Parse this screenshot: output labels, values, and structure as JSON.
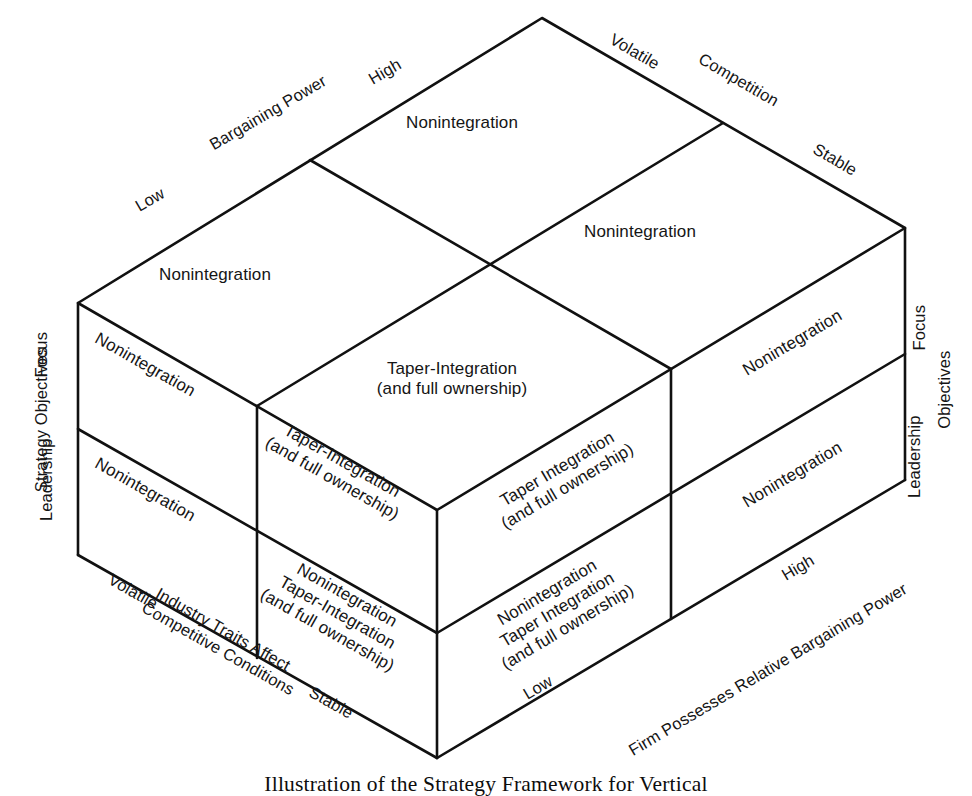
{
  "figure": {
    "caption": "Illustration of the Strategy Framework for Vertical",
    "type": "3d-cube-matrix-diagram"
  },
  "axes": {
    "top_back_left": {
      "name": "Bargaining Power",
      "ticks": [
        "Low",
        "High"
      ]
    },
    "top_back_right": {
      "name": "Competition",
      "ticks": [
        "Volatile",
        "Stable"
      ]
    },
    "left_vertical": {
      "name": "Strategy Objectives",
      "ticks": [
        "Focus",
        "Leadership"
      ]
    },
    "right_vertical": {
      "name": "Objectives",
      "ticks": [
        "Focus",
        "Leadership"
      ]
    },
    "bottom_front_left": {
      "name": "Industry Traits Affect Competitive Conditions",
      "name_line1": "Industry Traits Affect",
      "name_line2": "Competitive Conditions",
      "ticks": [
        "Volatile",
        "Stable"
      ]
    },
    "bottom_front_right": {
      "name": "Firm Possesses Relative Bargaining Power",
      "ticks": [
        "Low",
        "High"
      ]
    }
  },
  "top_face": {
    "cells": [
      {
        "id": "top-back-left",
        "text": "Nonintegration"
      },
      {
        "id": "top-back-right",
        "text": "Nonintegration"
      },
      {
        "id": "top-front-left",
        "text": "Nonintegration"
      },
      {
        "id": "top-front-right",
        "text": "Taper-Integration\n(and full ownership)"
      }
    ]
  },
  "left_face": {
    "cells": [
      {
        "id": "left-upper-back",
        "text": "Nonintegration"
      },
      {
        "id": "left-lower-back",
        "text": "Nonintegration"
      },
      {
        "id": "left-upper-front",
        "text": "Taper-Integration\n(and full ownership)"
      },
      {
        "id": "left-lower-front",
        "text": "Nonintegration\nTaper-Integration\n(and full ownership)"
      }
    ]
  },
  "right_face": {
    "cells": [
      {
        "id": "right-upper-left",
        "text": "Taper Integration\n(and full ownership)"
      },
      {
        "id": "right-lower-left",
        "text": "Nonintegration\nTaper Integration\n(and full ownership)"
      },
      {
        "id": "right-upper-right",
        "text": "Nonintegration"
      },
      {
        "id": "right-lower-right",
        "text": "Nonintegration"
      }
    ]
  },
  "colors": {
    "stroke": "#111111",
    "text": "#151515",
    "background": "#ffffff"
  }
}
